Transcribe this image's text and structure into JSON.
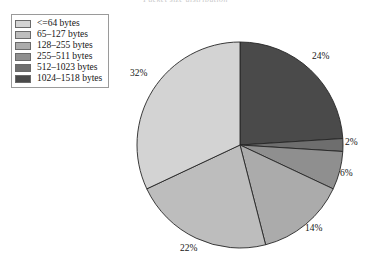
{
  "top_caption": "Packet size distribution",
  "legend": {
    "name": "packet-size-legend",
    "items": [
      {
        "label": "<=64 bytes",
        "color": "#d3d3d3"
      },
      {
        "label": "65–127 bytes",
        "color": "#bdbdbd"
      },
      {
        "label": "128–255 bytes",
        "color": "#ababab"
      },
      {
        "label": "255–511 bytes",
        "color": "#8f8f8f"
      },
      {
        "label": "512–1023 bytes",
        "color": "#6e6e6e"
      },
      {
        "label": "1024–1518 bytes",
        "color": "#4a4a4a"
      }
    ]
  },
  "chart_data": {
    "type": "pie",
    "title": "Packet size distribution",
    "xlabel": "",
    "ylabel": "",
    "start_angle_deg": 0,
    "direction": "clockwise",
    "center": {
      "x": 240,
      "y": 145
    },
    "radius": 103,
    "categories": [
      "1024–1518 bytes",
      "512–1023 bytes",
      "255–511 bytes",
      "128–255 bytes",
      "65–127 bytes",
      "<=64 bytes"
    ],
    "values": [
      24,
      2,
      6,
      14,
      22,
      32
    ],
    "labels": [
      "24%",
      "2%",
      "6%",
      "14%",
      "22%",
      "32%"
    ],
    "colors": [
      "#4a4a4a",
      "#6e6e6e",
      "#8f8f8f",
      "#ababab",
      "#bdbdbd",
      "#d3d3d3"
    ],
    "label_positions": [
      {
        "x": 312,
        "y": 51
      },
      {
        "x": 345,
        "y": 137
      },
      {
        "x": 340,
        "y": 168
      },
      {
        "x": 305,
        "y": 223
      },
      {
        "x": 180,
        "y": 243
      },
      {
        "x": 130,
        "y": 68
      }
    ],
    "legend_position": "top-left",
    "grid": false
  }
}
